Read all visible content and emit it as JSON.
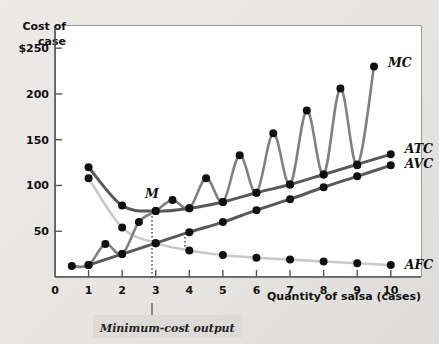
{
  "chart_data": {
    "type": "line",
    "title": "",
    "xlabel": "Quantity of salsa (cases)",
    "ylabel": "Cost of case",
    "xlim": [
      0,
      10.9
    ],
    "ylim": [
      0,
      272
    ],
    "grid": false,
    "legend_position": "right-of-curve-ends",
    "x_ticks": [
      "0",
      "1",
      "2",
      "3",
      "4",
      "5",
      "6",
      "7",
      "8",
      "9",
      "10"
    ],
    "x_tick_values": [
      0,
      1,
      2,
      3,
      4,
      5,
      6,
      7,
      8,
      9,
      10
    ],
    "y_ticks": [
      "50",
      "100",
      "150",
      "200",
      "$250"
    ],
    "y_tick_values": [
      50,
      100,
      150,
      200,
      250
    ],
    "annotations": [
      {
        "text": "M",
        "x": 3,
        "y": 72,
        "note": "minimum point of ATC"
      },
      {
        "text": "Minimum-cost output",
        "x": 3,
        "y": 0,
        "note": "axis callout at quantity 3"
      }
    ],
    "series": [
      {
        "name": "MC",
        "label": "MC",
        "color": "#808080",
        "x": [
          0.5,
          1.0,
          1.5,
          2.0,
          2.5,
          3.0,
          3.5,
          4.0,
          4.5,
          5.0,
          5.5,
          6.0,
          6.5,
          7.0,
          7.5,
          8.0,
          8.5,
          9.0,
          9.5
        ],
        "values": [
          12,
          13,
          36,
          25,
          60,
          72,
          84,
          75,
          108,
          82,
          133,
          92,
          157,
          101,
          182,
          112,
          206,
          122,
          230
        ]
      },
      {
        "name": "ATC",
        "label": "ATC",
        "color": "#595959",
        "x": [
          1,
          2,
          3,
          4,
          5,
          6,
          7,
          8,
          9,
          10
        ],
        "values": [
          120,
          78,
          72,
          75,
          82,
          92,
          101,
          112,
          123,
          134
        ]
      },
      {
        "name": "AVC",
        "label": "AVC",
        "color": "#595959",
        "x": [
          1,
          2,
          3,
          4,
          5,
          6,
          7,
          8,
          9,
          10
        ],
        "values": [
          13,
          25,
          37,
          49,
          60,
          73,
          85,
          98,
          110,
          122
        ]
      },
      {
        "name": "AFC",
        "label": "AFC",
        "color": "#c9c9c9",
        "x": [
          1,
          2,
          3,
          4,
          5,
          6,
          7,
          8,
          9,
          10
        ],
        "values": [
          108,
          54,
          37,
          29,
          24,
          21,
          19,
          17,
          15,
          13
        ]
      }
    ]
  },
  "axes": {
    "y_title_line1": "Cost of",
    "y_title_line2": "case",
    "x_title": "Quantity of salsa (cases)",
    "origin_label": "0"
  },
  "labels": {
    "mc": "MC",
    "atc": "ATC",
    "avc": "AVC",
    "afc": "AFC",
    "minimum_point": "M",
    "minimum_cost_output": "Minimum-cost output"
  },
  "colors": {
    "mc": "#808080",
    "atc": "#595959",
    "avc": "#595959",
    "afc": "#c9c9c9",
    "marker": "#111111",
    "plot_background": "#ffffff",
    "page_background": "#eceae7"
  }
}
